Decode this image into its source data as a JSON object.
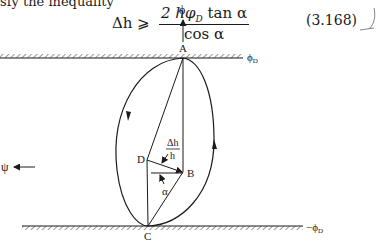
{
  "text": {
    "intro": "sfy the inequality",
    "equation": {
      "lhs": "Δh ⩾",
      "numerator": "2 hφ_D tan α",
      "numerator_main": "2 hφ",
      "numerator_sub": "D",
      "numerator_tail": " tan α",
      "denominator": "cos α"
    },
    "equation_number": "(3.168)"
  },
  "figure": {
    "labels": {
      "phi_axis": "ϕ",
      "psi_axis": "ψ",
      "point_a": "A",
      "point_b": "B",
      "point_c": "C",
      "point_d": "D",
      "ratio_num": "Δh",
      "ratio_den": "h",
      "angle": "α",
      "top_boundary": "ϕ",
      "top_boundary_sub": "D",
      "bottom_boundary": "−ϕ",
      "bottom_boundary_sub": "D"
    }
  }
}
